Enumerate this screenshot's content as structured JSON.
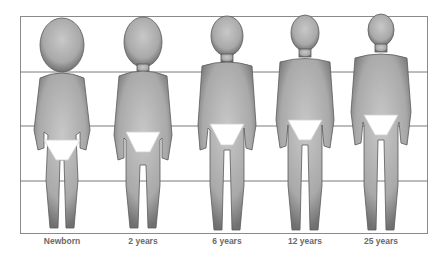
{
  "diagram": {
    "grid": {
      "lines": 5,
      "color": "#7a7a7a"
    },
    "figures": [
      {
        "label": "Newborn",
        "cx": 62,
        "head_fraction": "1/4"
      },
      {
        "label": "2 years",
        "cx": 143,
        "head_fraction": "1/5"
      },
      {
        "label": "6 years",
        "cx": 227,
        "head_fraction": "1/6"
      },
      {
        "label": "12 years",
        "cx": 305,
        "head_fraction": "1/7"
      },
      {
        "label": "25 years",
        "cx": 381,
        "head_fraction": "1/8"
      }
    ],
    "colors": {
      "skin": "#b8b8b8",
      "skin_dark": "#6e6e6e",
      "underwear": "#ffffff",
      "background": "#ffffff"
    }
  }
}
